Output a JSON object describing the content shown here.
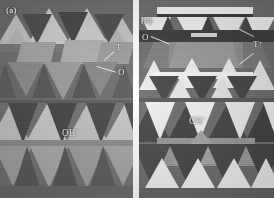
{
  "figure": {
    "kind": "polyhedral-crystal-structure-diagram",
    "width": 274,
    "height": 198,
    "background": "#ffffff",
    "gap_color": "#ffffff"
  },
  "palette": {
    "panel_background": "#6e6e6e",
    "dark_gray": "#4a4a4a",
    "mid_gray": "#7d7d7d",
    "light_gray": "#b9b9b9",
    "pale_gray": "#d6d6d6",
    "white": "#f4f4f4",
    "shadow": "#383838",
    "label_text": "#f2f2f2"
  },
  "panels": [
    {
      "id": "a",
      "label": "(a)",
      "label_pos": {
        "x": 6,
        "y": 6
      },
      "annotations": [
        {
          "id": "t-label-a",
          "text": "T",
          "x": 116,
          "y": 43,
          "leader": {
            "x1": 114,
            "y1": 50,
            "x2": 104,
            "y2": 60
          }
        },
        {
          "id": "o-label-a",
          "text": "O",
          "x": 118,
          "y": 69,
          "leader": {
            "x1": 116,
            "y1": 72,
            "x2": 97,
            "y2": 66
          }
        },
        {
          "id": "oh-label-a",
          "text": "OH",
          "sup": "−",
          "x": 62,
          "y": 127
        }
      ],
      "upper_section": {
        "y": 0,
        "height": 103,
        "desc": "tetrahedral-sheet-over-octahedral-sheet"
      },
      "lower_section": {
        "y": 103,
        "height": 95,
        "desc": "octahedral-hydroxyl-sheet"
      }
    },
    {
      "id": "b",
      "label": "(b)",
      "label_pos": {
        "x": 141,
        "y": 16
      },
      "annotations": [
        {
          "id": "o-label-b",
          "text": "O",
          "x": 143,
          "y": 37,
          "leader": {
            "x1": 150,
            "y1": 41,
            "x2": 166,
            "y2": 47
          }
        },
        {
          "id": "t-label-b",
          "text": "T",
          "x": 253,
          "y": 44,
          "leader": {
            "x1": 252,
            "y1": 40,
            "x2": 238,
            "y2": 31
          }
        },
        {
          "id": "t-label-b-leader2",
          "text": "",
          "x": 0,
          "y": 0,
          "leader": {
            "x1": 252,
            "y1": 51,
            "x2": 240,
            "y2": 66
          }
        },
        {
          "id": "oh-label-b",
          "text": "OH",
          "sup": "−",
          "x": 189,
          "y": 115
        }
      ],
      "upper_section": {
        "y": 0,
        "height": 100,
        "desc": "tetrahedral-octahedral-tetrahedral-layer"
      },
      "lower_section": {
        "y": 100,
        "height": 98,
        "desc": "octahedral-hydroxyl-sheet"
      }
    }
  ],
  "legend_terms": {
    "T": "tetrahedral sheet",
    "O": "octahedral sheet",
    "OH": "hydroxyl group"
  }
}
